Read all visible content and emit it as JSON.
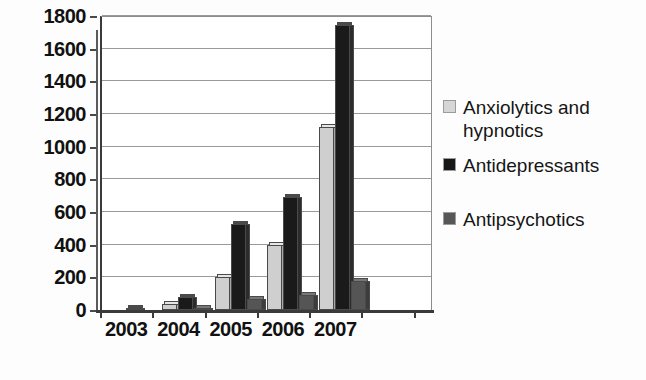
{
  "chart_data": {
    "type": "bar",
    "title": "",
    "subtitle": "",
    "xlabel": "",
    "ylabel": "",
    "categories": [
      "2003",
      "2004",
      "2005",
      "2006",
      "2007"
    ],
    "series": [
      {
        "name": "Anxiolytics and hypnotics",
        "color": "#cfcfcf",
        "values": [
          0,
          35,
          200,
          395,
          1120
        ]
      },
      {
        "name": "Antidepressants",
        "color": "#1a1a1a",
        "values": [
          5,
          80,
          525,
          690,
          1745
        ]
      },
      {
        "name": "Antipsychotics",
        "color": "#555555",
        "values": [
          0,
          15,
          70,
          90,
          180
        ]
      }
    ],
    "ylim": [
      0,
      1800
    ],
    "ytick_step": 200,
    "yticks": [
      0,
      200,
      400,
      600,
      800,
      1000,
      1200,
      1400,
      1600,
      1800
    ],
    "ytick_labels": [
      "0",
      "200",
      "400",
      "600",
      "800",
      "1000",
      "1200",
      "1400",
      "1600",
      "1800"
    ],
    "grid": true,
    "grid_axis": "y",
    "legend_position": "right",
    "bar_style": "3d-shadow",
    "plot_background": "#ffffff",
    "axis_color": "#3a3a3a",
    "gridline_color": "#9a9a9a"
  },
  "legend": {
    "entries": [
      {
        "label": "Anxiolytics and hypnotics",
        "swatch": "light-gray-swatch"
      },
      {
        "label": "Antidepressants",
        "swatch": "black-swatch"
      },
      {
        "label": "Antipsychotics",
        "swatch": "dark-gray-swatch"
      }
    ]
  }
}
